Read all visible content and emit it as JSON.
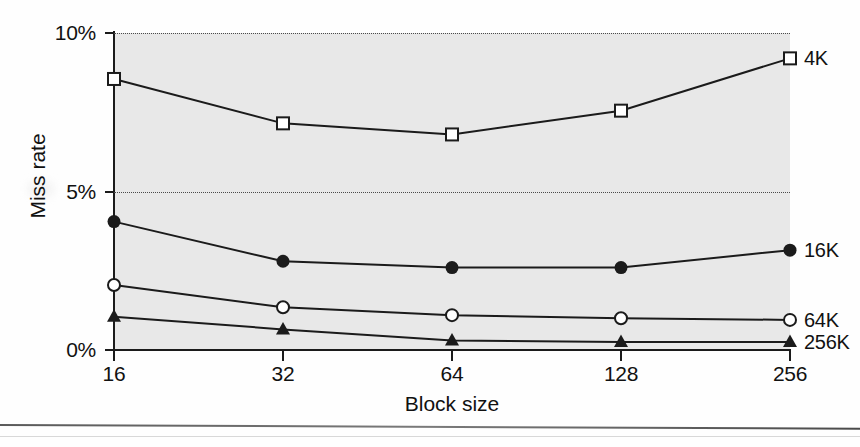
{
  "chart_data": {
    "type": "line",
    "title": "",
    "xlabel": "Block size",
    "ylabel": "Miss rate",
    "categories": [
      "16",
      "32",
      "64",
      "128",
      "256"
    ],
    "x": [
      16,
      32,
      64,
      128,
      256
    ],
    "xlim": [
      16,
      256
    ],
    "ylim": [
      0,
      10
    ],
    "yunit": "%",
    "ytick_labels": [
      "0%",
      "5%",
      "10%"
    ],
    "ytick_values": [
      0,
      5,
      10
    ],
    "xtick_labels": [
      "16",
      "32",
      "64",
      "128",
      "256"
    ],
    "grid": "horizontal-dotted",
    "legend_position": "right-inline-labels",
    "plot_background": "#e8e8e8",
    "line_color": "#1b1b1b",
    "series": [
      {
        "name": "4K",
        "marker": "open-square",
        "values": [
          8.55,
          7.15,
          6.8,
          7.55,
          9.2
        ]
      },
      {
        "name": "16K",
        "marker": "filled-circle",
        "values": [
          4.05,
          2.8,
          2.6,
          2.6,
          3.15
        ]
      },
      {
        "name": "64K",
        "marker": "open-circle",
        "values": [
          2.05,
          1.35,
          1.1,
          1.0,
          0.95
        ]
      },
      {
        "name": "256K",
        "marker": "filled-triangle",
        "values": [
          1.05,
          0.65,
          0.3,
          0.25,
          0.25
        ]
      }
    ]
  },
  "axes": {
    "y_title": "Miss rate",
    "x_title": "Block size"
  }
}
